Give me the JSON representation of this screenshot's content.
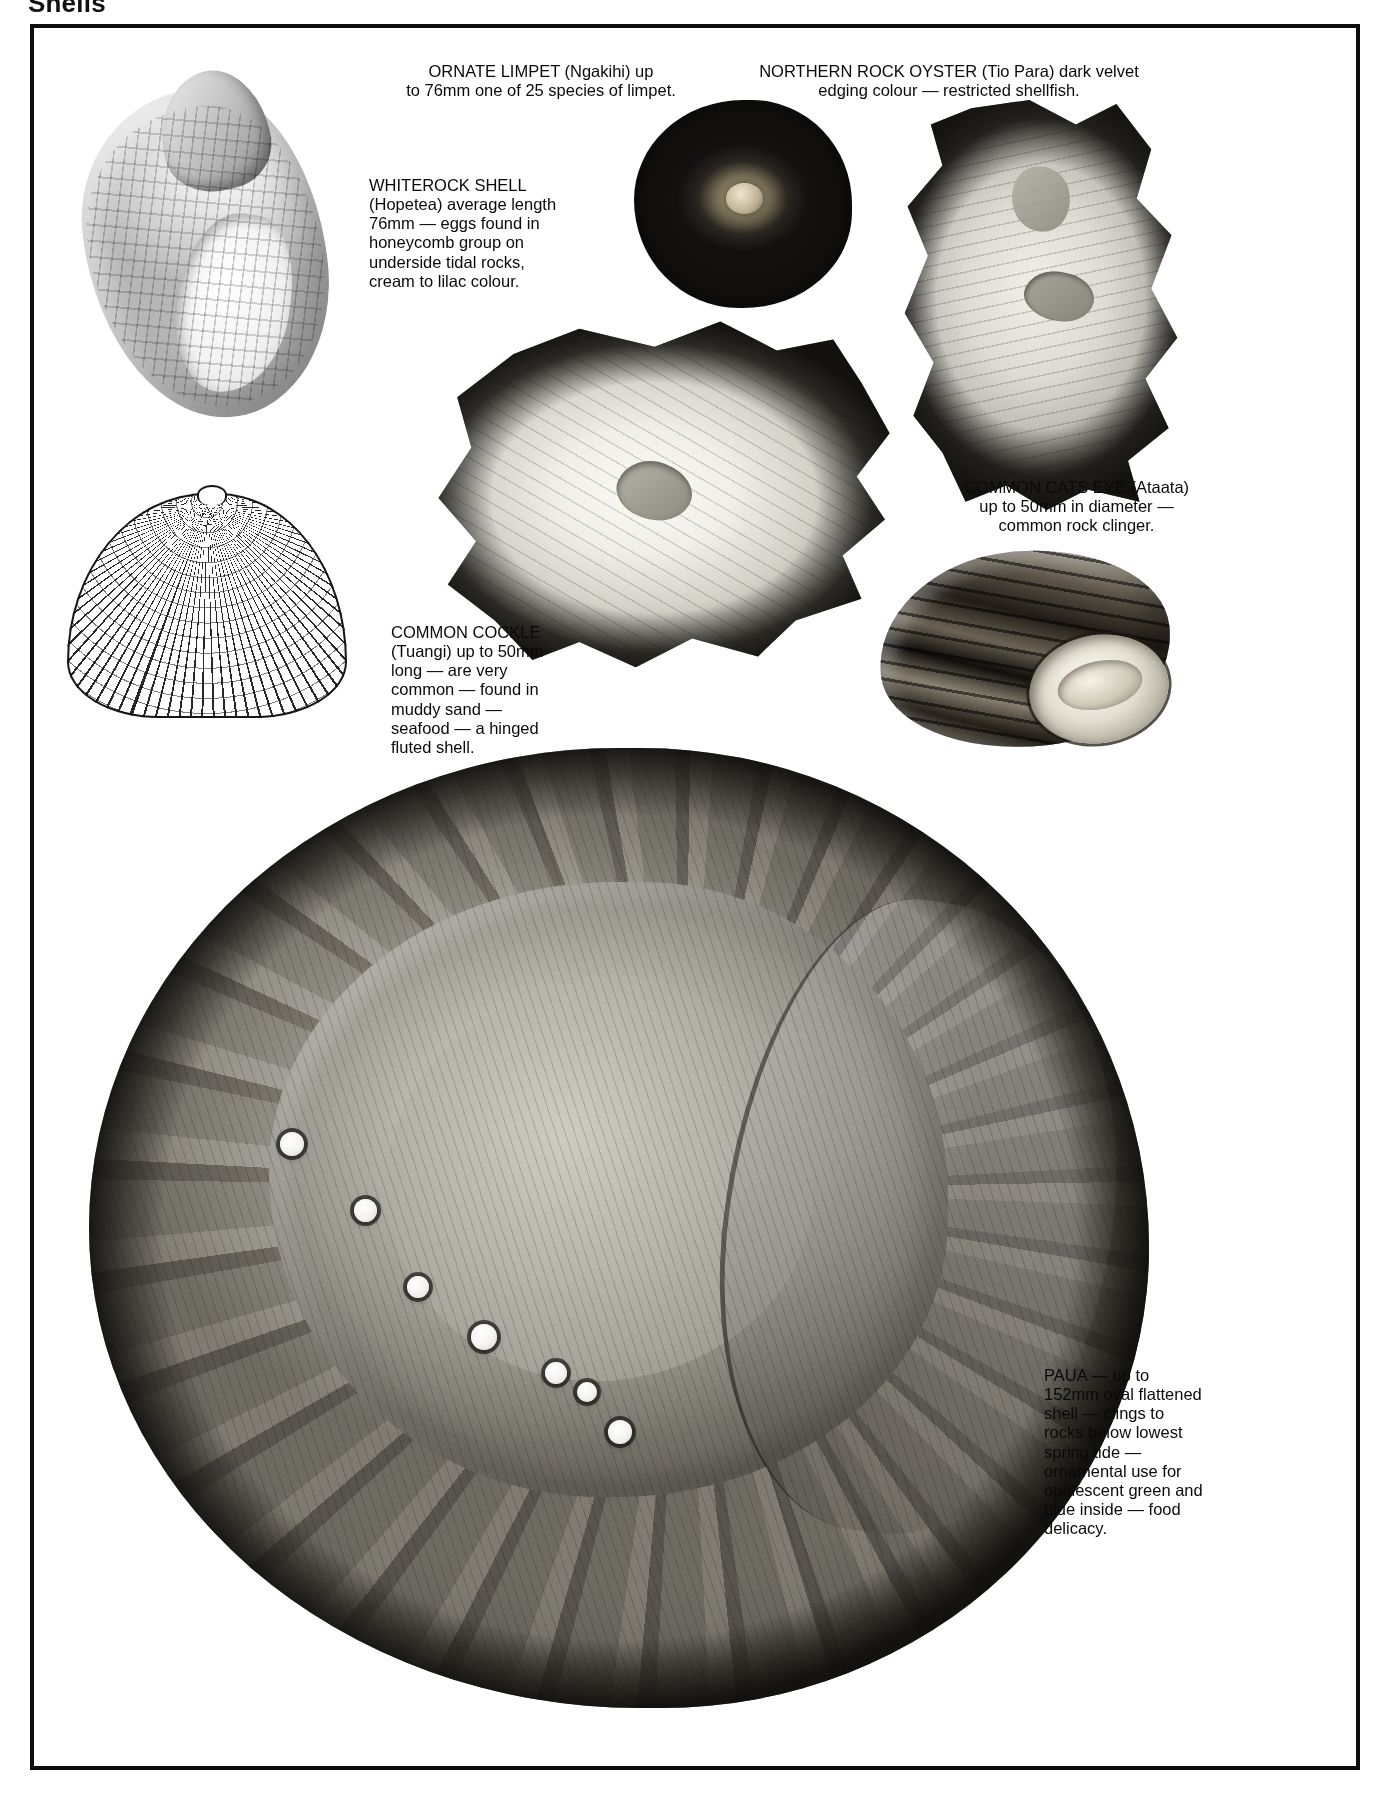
{
  "page": {
    "header_title": "Shells"
  },
  "plate": {
    "frame_color": "#0d0d0d",
    "background": "#ffffff"
  },
  "captions": {
    "ornate_limpet": "ORNATE LIMPET (Ngakihi) up\nto 76mm one of 25 species of limpet.",
    "northern_rock_oyster": "NORTHERN ROCK OYSTER (Tio Para) dark velvet\nedging colour — restricted shellfish.",
    "whiterock_shell": "WHITEROCK SHELL\n(Hopetea) average length\n76mm — eggs found in\nhoneycomb group on\nunderside tidal rocks,\ncream to lilac colour.",
    "common_cats_eye": "COMMON CATS EYE (Ataata)\nup to 50mm in diameter —\ncommon rock clinger.",
    "common_cockle": "COMMON COCKLE\n(Tuangi) up to 50mm\nlong — are very\ncommon — found in\nmuddy sand —\nseafood — a hinged\nfluted shell.",
    "paua": "PAUA — up to\n152mm oval flattened\nshell — clings to\nrocks below lowest\nspring tide —\nornamental use for\nopalescent green and\nblue inside — food\ndelicacy."
  },
  "illustrations": [
    {
      "name": "whiterock-shell-illustration",
      "species": "Whiterock Shell",
      "maori_name": "Hopetea",
      "size": "76mm"
    },
    {
      "name": "ornate-limpet-illustration",
      "species": "Ornate Limpet",
      "maori_name": "Ngakihi",
      "size": "76mm"
    },
    {
      "name": "northern-rock-oyster-illustration",
      "species": "Northern Rock Oyster",
      "maori_name": "Tio Para",
      "size": ""
    },
    {
      "name": "rock-oyster-large-illustration",
      "species": "Northern Rock Oyster",
      "maori_name": "Tio Para",
      "size": ""
    },
    {
      "name": "common-cockle-illustration",
      "species": "Common Cockle",
      "maori_name": "Tuangi",
      "size": "50mm"
    },
    {
      "name": "common-cats-eye-illustration",
      "species": "Common Cats Eye",
      "maori_name": "Ataata",
      "size": "50mm"
    },
    {
      "name": "paua-illustration",
      "species": "Paua",
      "maori_name": "",
      "size": "152mm"
    }
  ]
}
